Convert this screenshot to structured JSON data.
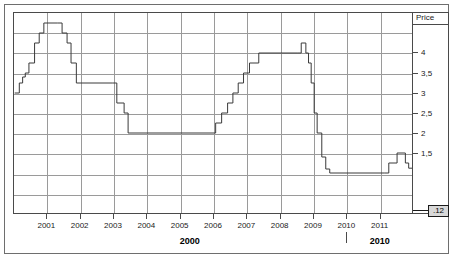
{
  "chart_data": {
    "type": "line",
    "line_style": "step",
    "title": "",
    "subtitle": "",
    "xlabel": "",
    "ylabel": "Price",
    "axis_label_position": "top-right",
    "xlim": [
      2000.0,
      2012.0
    ],
    "ylim": [
      0.0,
      5.0
    ],
    "grid": true,
    "legend": null,
    "y_ticks": [
      4,
      3.5,
      3,
      2.5,
      2,
      1.5
    ],
    "y_tick_labels": [
      "4",
      "3,5",
      "3",
      "2,5",
      "2",
      "1,5"
    ],
    "x_ticks": [
      2001,
      2002,
      2003,
      2004,
      2005,
      2006,
      2007,
      2008,
      2009,
      2010,
      2011
    ],
    "x_tick_labels": [
      "2001",
      "2002",
      "2003",
      "2004",
      "2005",
      "2006",
      "2007",
      "2008",
      "2009",
      "2010",
      "2011"
    ],
    "x_major_ticks": [
      2005.3,
      2011.0
    ],
    "x_major_labels": [
      "2000",
      "2010"
    ],
    "last_value_label": ".12",
    "series": [
      {
        "name": "Price",
        "color": "#3a3a3a",
        "points": [
          [
            2000.02,
            3.0
          ],
          [
            2000.16,
            3.25
          ],
          [
            2000.26,
            3.4
          ],
          [
            2000.34,
            3.5
          ],
          [
            2000.45,
            3.75
          ],
          [
            2000.62,
            4.25
          ],
          [
            2000.76,
            4.5
          ],
          [
            2000.9,
            4.75
          ],
          [
            2001.32,
            4.75
          ],
          [
            2001.45,
            4.5
          ],
          [
            2001.6,
            4.25
          ],
          [
            2001.72,
            3.75
          ],
          [
            2001.88,
            3.25
          ],
          [
            2002.96,
            3.25
          ],
          [
            2003.1,
            2.75
          ],
          [
            2003.32,
            2.5
          ],
          [
            2003.44,
            2.0
          ],
          [
            2005.88,
            2.0
          ],
          [
            2006.08,
            2.25
          ],
          [
            2006.26,
            2.5
          ],
          [
            2006.44,
            2.75
          ],
          [
            2006.6,
            3.0
          ],
          [
            2006.76,
            3.25
          ],
          [
            2006.92,
            3.5
          ],
          [
            2007.1,
            3.75
          ],
          [
            2007.38,
            4.0
          ],
          [
            2008.56,
            4.0
          ],
          [
            2008.66,
            4.25
          ],
          [
            2008.8,
            4.0
          ],
          [
            2008.88,
            3.75
          ],
          [
            2008.96,
            3.25
          ],
          [
            2009.05,
            2.5
          ],
          [
            2009.14,
            2.0
          ],
          [
            2009.28,
            1.4
          ],
          [
            2009.4,
            1.1
          ],
          [
            2009.52,
            1.0
          ],
          [
            2011.18,
            1.0
          ],
          [
            2011.3,
            1.25
          ],
          [
            2011.55,
            1.5
          ],
          [
            2011.8,
            1.25
          ],
          [
            2011.9,
            1.12
          ],
          [
            2012.0,
            1.12
          ]
        ]
      }
    ]
  },
  "axis": {
    "price_header": "Price",
    "last_value": ".12"
  }
}
